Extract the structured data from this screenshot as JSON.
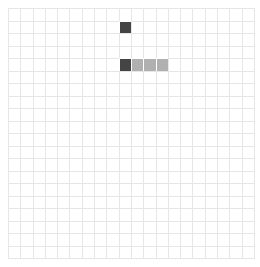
{
  "board": {
    "cols": 20,
    "rows": 20,
    "filled": [
      {
        "row": 1,
        "col": 9,
        "state": "dark"
      },
      {
        "row": 4,
        "col": 9,
        "state": "dark"
      },
      {
        "row": 4,
        "col": 10,
        "state": "gray"
      },
      {
        "row": 4,
        "col": 11,
        "state": "gray"
      },
      {
        "row": 4,
        "col": 12,
        "state": "gray"
      }
    ],
    "colors": {
      "dark": "#444444",
      "gray": "#b0b0b0",
      "grid": "#e6e6e6"
    }
  }
}
